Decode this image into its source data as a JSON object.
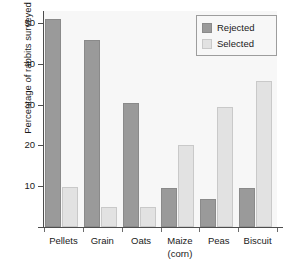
{
  "chart_data": {
    "type": "bar",
    "title": "",
    "xlabel": "",
    "ylabel": "Percentage of rabbits surveyed",
    "categories": [
      "Pellets",
      "Grain",
      "Oats",
      "Maize (corn)",
      "Peas",
      "Biscuit"
    ],
    "category_lines": [
      [
        "Pellets"
      ],
      [
        "Grain"
      ],
      [
        "Oats"
      ],
      [
        "Maize",
        "(corn)"
      ],
      [
        "Peas"
      ],
      [
        "Biscuit"
      ]
    ],
    "series": [
      {
        "name": "Rejected",
        "color": "#9a9a9a",
        "values": [
          51,
          46,
          30.5,
          9.5,
          6.8,
          9.5
        ]
      },
      {
        "name": "Selected",
        "color": "#e2e2e2",
        "values": [
          9.8,
          4.8,
          4.8,
          20,
          29.5,
          35.8
        ]
      }
    ],
    "ylim": [
      0,
      53
    ],
    "yticks": [
      10,
      20,
      30,
      40,
      50
    ],
    "ytick_labels": [
      "10",
      "20",
      "30",
      "40",
      "50"
    ],
    "grid": false,
    "legend_position": "top-right"
  },
  "legend": {
    "entries": [
      {
        "label": "Rejected"
      },
      {
        "label": "Selected"
      }
    ]
  }
}
